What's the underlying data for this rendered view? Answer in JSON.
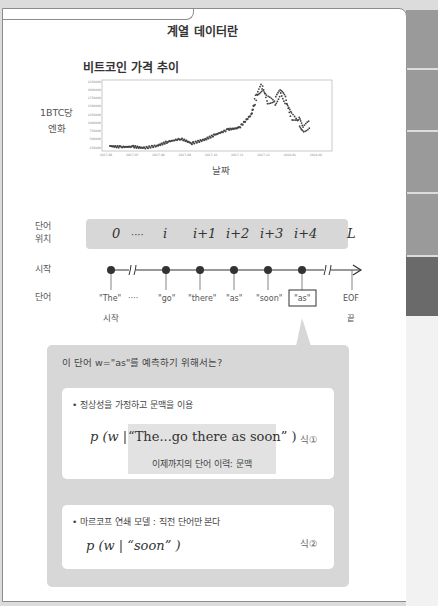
{
  "page": {
    "title": "계열 데이터란"
  },
  "chart_data": {
    "type": "scatter",
    "title": "비트코인 가격 추이",
    "xlabel": "날짜",
    "ylabel": "1BTC당 엔화",
    "ylabel_lines": [
      "1BTC당",
      "엔화"
    ],
    "x_ticks": [
      "2017-06",
      "2017-07",
      "2017-08",
      "2017-09",
      "2017-10",
      "2017-11",
      "2017-12",
      "2018-01",
      "2018-02"
    ],
    "y_ticks": [
      2250000,
      2000000,
      1750000,
      1500000,
      1250000,
      1000000,
      750000,
      500000,
      250000
    ],
    "ylim": [
      150000,
      2300000
    ],
    "grid": false,
    "x": [
      "2017-06-01",
      "2017-06-15",
      "2017-07-01",
      "2017-07-15",
      "2017-08-01",
      "2017-08-15",
      "2017-09-01",
      "2017-09-15",
      "2017-10-01",
      "2017-10-15",
      "2017-11-01",
      "2017-11-15",
      "2017-12-01",
      "2017-12-08",
      "2017-12-15",
      "2017-12-22",
      "2018-01-01",
      "2018-01-08",
      "2018-01-15",
      "2018-01-22",
      "2018-02-01",
      "2018-02-06",
      "2018-02-15"
    ],
    "values": [
      300000,
      270000,
      280000,
      240000,
      310000,
      430000,
      520000,
      380000,
      490000,
      640000,
      800000,
      850000,
      1250000,
      1850000,
      2100000,
      1700000,
      1650000,
      1950000,
      1650000,
      1200000,
      1050000,
      800000,
      970000
    ]
  },
  "diagram": {
    "row_labels": {
      "position": [
        "단어",
        "위치"
      ],
      "start": "시작",
      "word": "단어"
    },
    "positions": [
      "0",
      "····",
      "i",
      "i+1",
      "i+2",
      "i+3",
      "i+4",
      "L"
    ],
    "words": [
      "\"The\"",
      "····",
      "\"go\"",
      "\"there\"",
      "\"as\"",
      "\"soon\"",
      "\"as\"",
      "EOF"
    ],
    "start_label": "시작",
    "end_label": "끝",
    "highlighted_word_index": 6
  },
  "callout": {
    "question": "이 단어 w=\"as\"를 예측하기 위해서는?",
    "cards": [
      {
        "bullet": "• 정상성을 가정하고 문맥을 이용",
        "formula_prefix": "p (w | ",
        "formula_context": "“The...go there as soon” )",
        "context_label": "이제까지의 단어 이력: 문맥",
        "eq_num": "식①"
      },
      {
        "bullet": "• 마르코프 연쇄 모델 : 직전 단어만 본다",
        "formula": "p (w | “soon” )",
        "eq_num": "식②"
      }
    ]
  }
}
